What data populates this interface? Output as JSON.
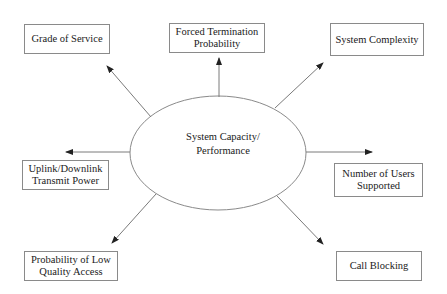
{
  "diagram": {
    "center": {
      "label": "System Capacity/\nPerformance"
    },
    "nodes": [
      {
        "id": "grade-of-service",
        "label": "Grade of Service"
      },
      {
        "id": "forced-termination",
        "label": "Forced Termination\nProbability"
      },
      {
        "id": "system-complexity",
        "label": "System Complexity"
      },
      {
        "id": "uplink-downlink",
        "label": "Uplink/Downlink\nTransmit Power"
      },
      {
        "id": "number-of-users",
        "label": "Number of Users\nSupported"
      },
      {
        "id": "low-quality-access",
        "label": "Probability of Low\nQuality Access"
      },
      {
        "id": "call-blocking",
        "label": "Call Blocking"
      }
    ],
    "edges": [
      {
        "from": "center",
        "to": "grade-of-service"
      },
      {
        "from": "center",
        "to": "forced-termination"
      },
      {
        "from": "center",
        "to": "system-complexity"
      },
      {
        "from": "center",
        "to": "uplink-downlink"
      },
      {
        "from": "center",
        "to": "number-of-users"
      },
      {
        "from": "center",
        "to": "low-quality-access"
      },
      {
        "from": "center",
        "to": "call-blocking"
      }
    ],
    "colors": {
      "line": "#7a7a7a",
      "text": "#1a1a1a",
      "background": "#ffffff"
    }
  }
}
